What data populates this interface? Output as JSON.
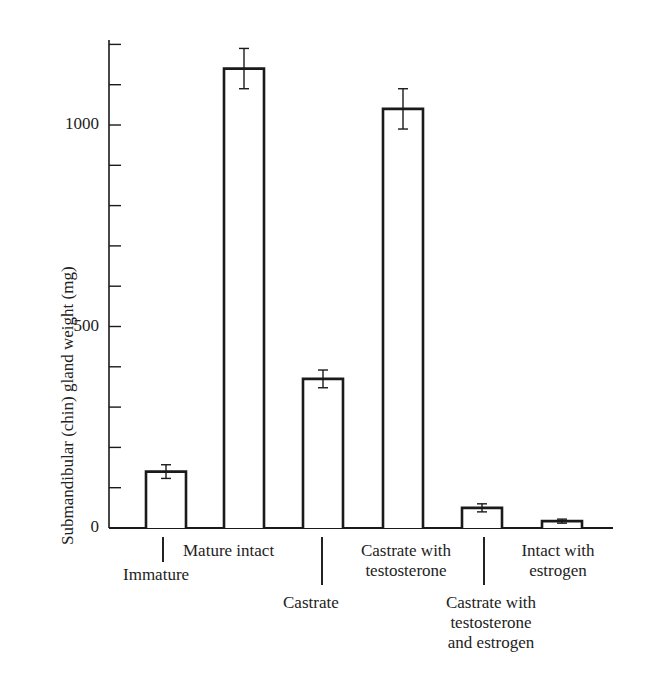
{
  "chart_data": {
    "type": "bar",
    "title": "",
    "xlabel": "",
    "ylabel": "Submandibular (chin) gland weight (mg)",
    "ylim": [
      0,
      1200
    ],
    "yticks": [
      0,
      100,
      200,
      300,
      400,
      500,
      600,
      700,
      800,
      900,
      1000,
      1100,
      1200
    ],
    "ytick_labels": [
      "0",
      "500",
      "1000"
    ],
    "grid": false,
    "legend": null,
    "categories": [
      "Immature",
      "Mature intact",
      "Castrate",
      "Castrate with testosterone",
      "Castrate with testosterone and estrogen",
      "Intact with estrogen"
    ],
    "values": [
      140,
      1140,
      370,
      1040,
      50,
      17
    ],
    "errors": [
      17,
      50,
      22,
      50,
      10,
      5
    ],
    "bar_fill": "#ffffff",
    "bar_edge": "#1a1a1a"
  },
  "labels": {
    "ylabel": "Submandibular (chin) gland weight (mg)",
    "y0": "0",
    "y500": "500",
    "y1000": "1000",
    "cat0": "Immature",
    "cat1": "Mature intact",
    "cat2": "Castrate",
    "cat3_l1": "Castrate with",
    "cat3_l2": "testosterone",
    "cat4_l1": "Castrate with",
    "cat4_l2": "testosterone",
    "cat4_l3": "and estrogen",
    "cat5_l1": "Intact with",
    "cat5_l2": "estrogen"
  }
}
